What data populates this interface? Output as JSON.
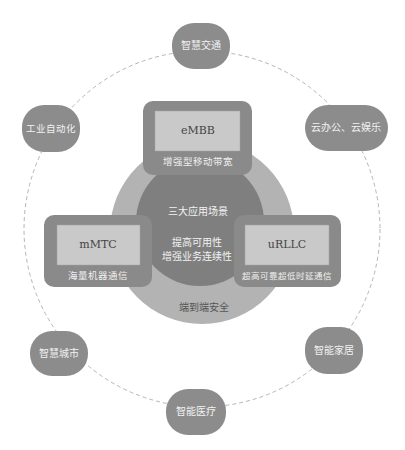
{
  "diagram": {
    "topic": "5G",
    "colors": {
      "satellite_fill": "#8c8c8c",
      "box_outer_fill": "#8a8a8a",
      "box_inner_fill": "#c9c9c9",
      "middle_ring_fill": "#b3b3b3",
      "inner_circle_fill": "#7f7f7f",
      "dashed_ring_stroke": "#b5b5b5"
    },
    "center": {
      "title": "三大应用场景",
      "line1": "提高可用性",
      "line2": "增强业务连续性"
    },
    "ring_label": "端到端安全",
    "scenarios": [
      {
        "id": "embb",
        "name": "eMBB",
        "description": "增强型移动带宽"
      },
      {
        "id": "mmtc",
        "name": "mMTC",
        "description": "海量机器通信"
      },
      {
        "id": "urllc",
        "name": "uRLLC",
        "description": "超高可靠超低时延通信"
      }
    ],
    "applications": [
      {
        "id": "top",
        "label": "智慧交通"
      },
      {
        "id": "top-left",
        "label": "工业自动化"
      },
      {
        "id": "top-right",
        "label": "云办公、云娱乐"
      },
      {
        "id": "bottom-left",
        "label": "智慧城市"
      },
      {
        "id": "bottom-right",
        "label": "智能家居"
      },
      {
        "id": "bottom",
        "label": "智能医疗"
      }
    ]
  }
}
